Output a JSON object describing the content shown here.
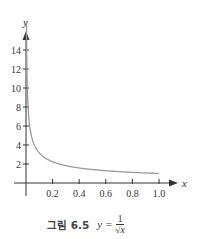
{
  "chart_data": {
    "type": "line",
    "title": "",
    "function": "y = 1/sqrt(x)",
    "xlabel": "x",
    "ylabel": "y",
    "xlim": [
      0,
      1.0
    ],
    "ylim": [
      0,
      14
    ],
    "xticks": [
      0.2,
      0.4,
      0.6,
      0.8,
      1.0
    ],
    "xtick_labels": [
      "0.2",
      "0.4",
      "0.6",
      "0.8",
      "1.0"
    ],
    "yticks": [
      2,
      4,
      6,
      8,
      10,
      12,
      14
    ],
    "ytick_labels": [
      "2",
      "4",
      "6",
      "8",
      "10",
      "12",
      "14"
    ],
    "grid": false,
    "series": [
      {
        "name": "y = 1/√x",
        "color": "#999999",
        "x": [
          0.005,
          0.01,
          0.02,
          0.03,
          0.05,
          0.075,
          0.1,
          0.15,
          0.2,
          0.3,
          0.4,
          0.5,
          0.6,
          0.7,
          0.8,
          0.9,
          1.0
        ],
        "y": [
          14.14,
          10.0,
          7.07,
          5.77,
          4.47,
          3.65,
          3.16,
          2.58,
          2.24,
          1.83,
          1.58,
          1.41,
          1.29,
          1.2,
          1.12,
          1.05,
          1.0
        ]
      }
    ]
  },
  "caption": {
    "label": "그림 6.5",
    "equation_lhs": "y =",
    "numerator": "1",
    "denominator": "√x"
  }
}
